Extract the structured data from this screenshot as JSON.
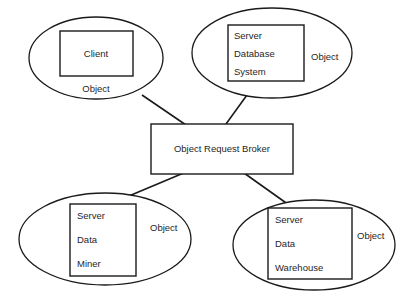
{
  "diagram": {
    "colors": {
      "stroke": "#1a1a1a",
      "background": "#ffffff",
      "text": "#1f1f1f"
    },
    "center_node": {
      "label": "Object Request Broker"
    },
    "nodes": [
      {
        "id": "client",
        "position": "top-left",
        "object_label": "Object",
        "inner_lines": [
          "Client"
        ]
      },
      {
        "id": "server-database-system",
        "position": "top-right",
        "object_label": "Object",
        "inner_lines": [
          "Server",
          "Database",
          "System"
        ]
      },
      {
        "id": "server-data-miner",
        "position": "bottom-left",
        "object_label": "Object",
        "inner_lines": [
          "Server",
          "Data",
          "Miner"
        ]
      },
      {
        "id": "server-data-warehouse",
        "position": "bottom-right",
        "object_label": "Object",
        "inner_lines": [
          "Server",
          "Data",
          "Warehouse"
        ]
      }
    ],
    "connectors": [
      {
        "from": "client",
        "to": "center_node"
      },
      {
        "from": "server-database-system",
        "to": "center_node"
      },
      {
        "from": "server-data-miner",
        "to": "center_node"
      },
      {
        "from": "server-data-warehouse",
        "to": "center_node"
      }
    ]
  }
}
